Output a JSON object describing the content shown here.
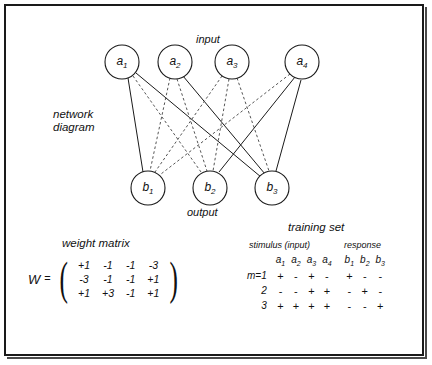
{
  "figure": {
    "labels": {
      "input": "input",
      "output": "output",
      "network_diagram_line1": "network",
      "network_diagram_line2": "diagram",
      "weight_matrix": "weight matrix",
      "training_set": "training set",
      "stimulus": "stimulus (input)",
      "response": "response"
    }
  },
  "network": {
    "input_nodes": [
      {
        "label": "a",
        "sub": "1"
      },
      {
        "label": "a",
        "sub": "2"
      },
      {
        "label": "a",
        "sub": "3"
      },
      {
        "label": "a",
        "sub": "4"
      }
    ],
    "output_nodes": [
      {
        "label": "b",
        "sub": "1"
      },
      {
        "label": "b",
        "sub": "2"
      },
      {
        "label": "b",
        "sub": "3"
      }
    ]
  },
  "weight_matrix": {
    "symbol": "W",
    "equals": "=",
    "rows": [
      [
        "+1",
        "-1",
        "-1",
        "-3"
      ],
      [
        "-3",
        "-1",
        "-1",
        "+1"
      ],
      [
        "+1",
        "+3",
        "-1",
        "+1"
      ]
    ]
  },
  "training_set": {
    "stimulus_headers": [
      {
        "label": "a",
        "sub": "1"
      },
      {
        "label": "a",
        "sub": "2"
      },
      {
        "label": "a",
        "sub": "3"
      },
      {
        "label": "a",
        "sub": "4"
      }
    ],
    "response_headers": [
      {
        "label": "b",
        "sub": "1"
      },
      {
        "label": "b",
        "sub": "2"
      },
      {
        "label": "b",
        "sub": "3"
      }
    ],
    "rows": [
      {
        "label": "m=1",
        "stimulus": [
          "+",
          "-",
          "+",
          "-"
        ],
        "response": [
          "+",
          "-",
          "-"
        ]
      },
      {
        "label": "2",
        "stimulus": [
          "-",
          "-",
          "+",
          "+"
        ],
        "response": [
          "-",
          "+",
          "-"
        ]
      },
      {
        "label": "3",
        "stimulus": [
          "+",
          "+",
          "+",
          "+"
        ],
        "response": [
          "-",
          "-",
          "+"
        ]
      }
    ]
  },
  "colors": {
    "ink": "#1a1a1a",
    "dashed": "#555555",
    "background": "#ffffff"
  }
}
